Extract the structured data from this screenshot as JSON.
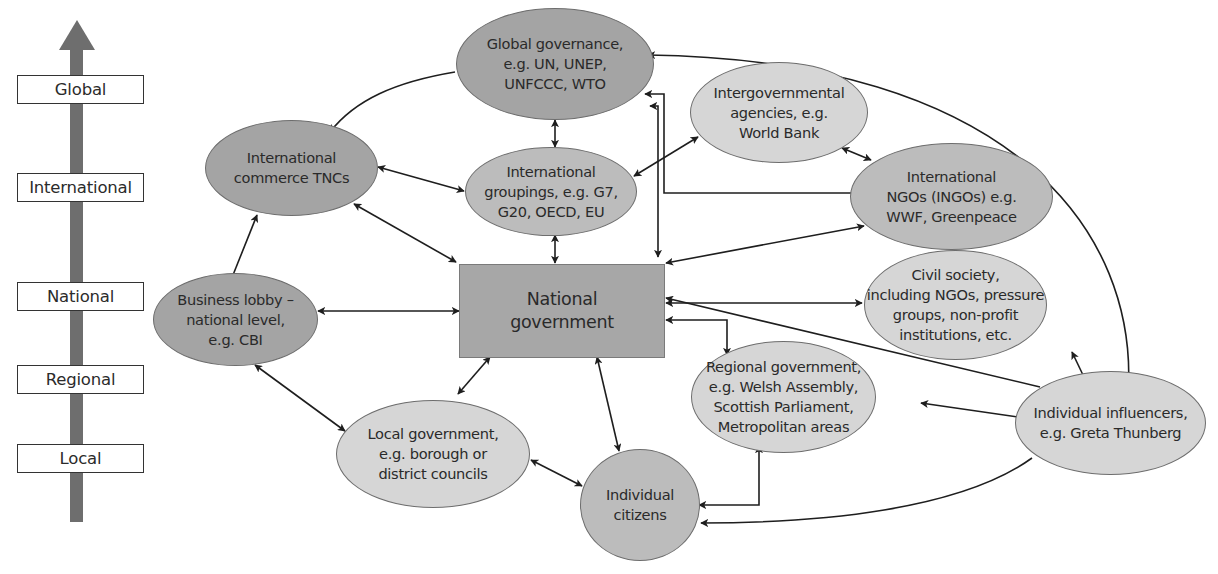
{
  "scale": {
    "direction": "up",
    "levels": [
      {
        "label": "Global"
      },
      {
        "label": "International"
      },
      {
        "label": "National"
      },
      {
        "label": "Regional"
      },
      {
        "label": "Local"
      }
    ]
  },
  "nodes": {
    "global_governance": {
      "label": "Global governance,\ne.g. UN, UNEP,\nUNFCCC, WTO",
      "shade": "dark"
    },
    "intergovernmental_agencies": {
      "label": "Intergovernmental\nagencies, e.g.\nWorld Bank",
      "shade": "light"
    },
    "international_commerce": {
      "label": "International\ncommerce TNCs",
      "shade": "dark"
    },
    "international_groupings": {
      "label": "International\ngroupings, e.g. G7,\nG20, OECD, EU",
      "shade": "mid"
    },
    "ingos": {
      "label": "International\nNGOs (INGOs) e.g.\nWWF, Greenpeace",
      "shade": "mid"
    },
    "civil_society": {
      "label": "Civil society,\nincluding NGOs, pressure\ngroups, non-profit\ninstitutions, etc.",
      "shade": "light"
    },
    "business_lobby": {
      "label": "Business lobby –\nnational level,\ne.g. CBI",
      "shade": "dark"
    },
    "national_government": {
      "label": "National\ngovernment",
      "shade": "rect"
    },
    "regional_government": {
      "label": "Regional government,\ne.g. Welsh Assembly,\nScottish Parliament,\nMetropolitan areas",
      "shade": "light"
    },
    "individual_influencers": {
      "label": "Individual influencers,\ne.g. Greta Thunberg",
      "shade": "light"
    },
    "local_government": {
      "label": "Local government,\ne.g. borough or\ndistrict councils",
      "shade": "light"
    },
    "individual_citizens": {
      "label": "Individual\ncitizens",
      "shade": "mid"
    }
  },
  "edges": [
    {
      "from": "global_governance",
      "to": "international_commerce",
      "type": "one-way"
    },
    {
      "from": "global_governance",
      "to": "international_groupings",
      "type": "two-way"
    },
    {
      "from": "global_governance",
      "to": "national_government",
      "type": "two-way"
    },
    {
      "from": "global_governance",
      "to": "ingos",
      "type": "two-way"
    },
    {
      "from": "international_commerce",
      "to": "international_groupings",
      "type": "two-way"
    },
    {
      "from": "international_commerce",
      "to": "national_government",
      "type": "two-way"
    },
    {
      "from": "business_lobby",
      "to": "international_commerce",
      "type": "one-way"
    },
    {
      "from": "international_groupings",
      "to": "intergovernmental_agencies",
      "type": "two-way"
    },
    {
      "from": "international_groupings",
      "to": "national_government",
      "type": "two-way"
    },
    {
      "from": "intergovernmental_agencies",
      "to": "ingos",
      "type": "two-way"
    },
    {
      "from": "ingos",
      "to": "national_government",
      "type": "two-way"
    },
    {
      "from": "national_government",
      "to": "civil_society",
      "type": "two-way"
    },
    {
      "from": "national_government",
      "to": "regional_government",
      "type": "two-way"
    },
    {
      "from": "business_lobby",
      "to": "national_government",
      "type": "two-way"
    },
    {
      "from": "national_government",
      "to": "local_government",
      "type": "two-way"
    },
    {
      "from": "national_government",
      "to": "individual_citizens",
      "type": "two-way"
    },
    {
      "from": "business_lobby",
      "to": "local_government",
      "type": "two-way"
    },
    {
      "from": "local_government",
      "to": "individual_citizens",
      "type": "two-way"
    },
    {
      "from": "regional_government",
      "to": "individual_citizens",
      "type": "two-way"
    },
    {
      "from": "individual_influencers",
      "to": "global_governance",
      "type": "one-way"
    },
    {
      "from": "individual_influencers",
      "to": "civil_society",
      "type": "one-way"
    },
    {
      "from": "individual_influencers",
      "to": "national_government",
      "type": "one-way"
    },
    {
      "from": "individual_influencers",
      "to": "regional_government",
      "type": "one-way"
    },
    {
      "from": "individual_influencers",
      "to": "individual_citizens",
      "type": "one-way"
    }
  ],
  "colors": {
    "dark_node": "#a4a4a4",
    "mid_node": "#bcbcbc",
    "light_node": "#d6d6d6",
    "rect_node": "#a7a7a7",
    "arrow": "#1e1e1e",
    "scale_arrow": "#6e6e6e"
  }
}
